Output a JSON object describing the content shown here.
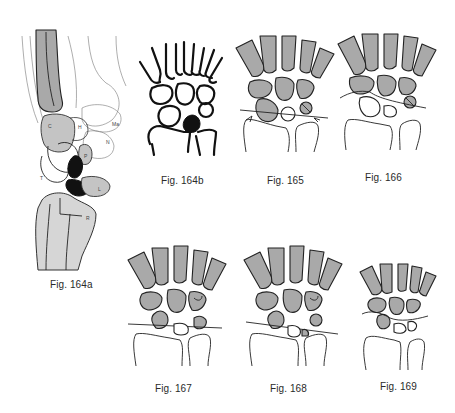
{
  "page": {
    "type": "anatomical-figure-plate"
  },
  "figures": [
    {
      "id": "164a",
      "caption": "Fig. 164a",
      "view": "lateral",
      "labels": [
        "C",
        "H",
        "Ma",
        "N",
        "P",
        "T",
        "L",
        "R"
      ]
    },
    {
      "id": "164b",
      "caption": "Fig. 164b",
      "view": "PA outline"
    },
    {
      "id": "165",
      "caption": "Fig. 165",
      "view": "PA shaded"
    },
    {
      "id": "166",
      "caption": "Fig. 166",
      "view": "PA shaded"
    },
    {
      "id": "167",
      "caption": "Fig. 167",
      "view": "PA shaded"
    },
    {
      "id": "168",
      "caption": "Fig. 168",
      "view": "PA shaded"
    },
    {
      "id": "169",
      "caption": "Fig. 169",
      "view": "PA shaded"
    }
  ],
  "colors": {
    "bone_fill": "#a9a9a9",
    "light_fill": "#d6d6d6",
    "dark_fill": "#111111",
    "ink": "#222222"
  }
}
